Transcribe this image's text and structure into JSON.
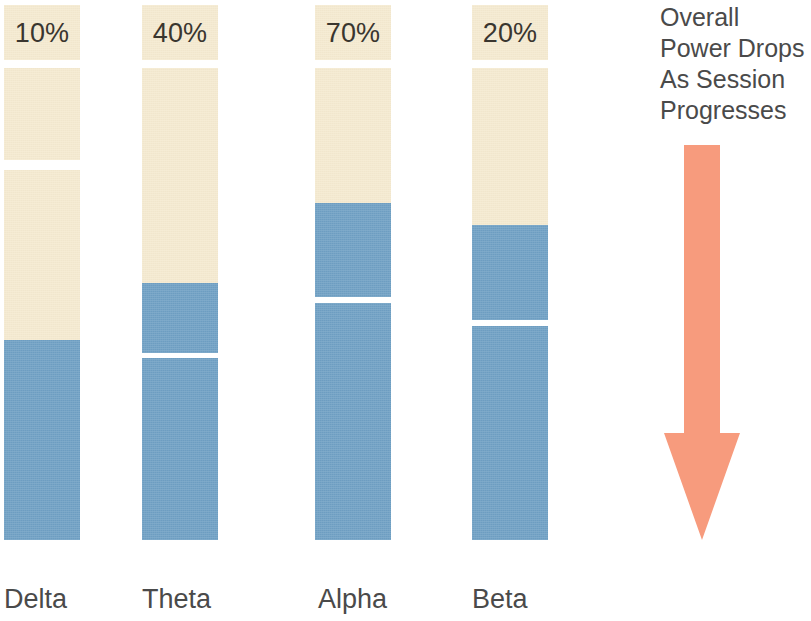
{
  "chart_data": {
    "type": "bar",
    "title": "",
    "subtitle": "",
    "xlabel": "",
    "ylabel": "",
    "categories": [
      "Delta",
      "Theta",
      "Alpha",
      "Beta"
    ],
    "data_labels": [
      "10%",
      "40%",
      "70%",
      "20%"
    ],
    "series": [
      {
        "name": "Remaining power (cream)",
        "values": [
          63,
          52,
          37,
          41
        ]
      },
      {
        "name": "Power drop (blue)",
        "values": [
          37,
          48,
          63,
          59
        ]
      }
    ],
    "legend_position": "none",
    "grid": false,
    "ylim": [
      0,
      100
    ],
    "annotations": [
      {
        "kind": "text-block",
        "text": "Overall Power Drops As Session Progresses",
        "position": "right-top"
      },
      {
        "kind": "arrow",
        "direction": "down",
        "position": "right",
        "color": "#f79b7d"
      }
    ],
    "colors": {
      "cream": "#f5ead0",
      "blue": "#6fa0c4",
      "arrow": "#f79b7d",
      "background": "#ffffff",
      "text": "#4a4a4a"
    },
    "note": "Each column is a stacked bar split into blocks by thin white gaps; the percentage caption sits in the topmost cream block of each column."
  },
  "columns": [
    {
      "name": "delta",
      "label": "Delta",
      "percent": "10%",
      "x": 4,
      "width": 76,
      "label_left": 4,
      "segments": [
        {
          "tone": "cream",
          "top": 0,
          "height": 55,
          "has_label": true
        },
        {
          "tone": "cream",
          "top": 63,
          "height": 92,
          "has_label": false
        },
        {
          "tone": "cream",
          "top": 165,
          "height": 170,
          "has_label": false
        },
        {
          "tone": "blue",
          "top": 335,
          "height": 200,
          "has_label": false
        }
      ]
    },
    {
      "name": "theta",
      "label": "Theta",
      "percent": "40%",
      "x": 142,
      "width": 76,
      "label_left": 142,
      "segments": [
        {
          "tone": "cream",
          "top": 0,
          "height": 55,
          "has_label": true
        },
        {
          "tone": "cream",
          "top": 63,
          "height": 215,
          "has_label": false
        },
        {
          "tone": "blue",
          "top": 278,
          "height": 70,
          "has_label": false
        },
        {
          "tone": "blue",
          "top": 353,
          "height": 182,
          "has_label": false
        }
      ]
    },
    {
      "name": "alpha",
      "label": "Alpha",
      "percent": "70%",
      "x": 315,
      "width": 76,
      "label_left": 318,
      "segments": [
        {
          "tone": "cream",
          "top": 0,
          "height": 55,
          "has_label": true
        },
        {
          "tone": "cream",
          "top": 63,
          "height": 135,
          "has_label": false
        },
        {
          "tone": "blue",
          "top": 198,
          "height": 94,
          "has_label": false
        },
        {
          "tone": "blue",
          "top": 298,
          "height": 237,
          "has_label": false
        }
      ]
    },
    {
      "name": "beta",
      "label": "Beta",
      "percent": "20%",
      "x": 472,
      "width": 76,
      "label_left": 472,
      "segments": [
        {
          "tone": "cream",
          "top": 0,
          "height": 55,
          "has_label": true
        },
        {
          "tone": "cream",
          "top": 63,
          "height": 157,
          "has_label": false
        },
        {
          "tone": "blue",
          "top": 220,
          "height": 95,
          "has_label": false
        },
        {
          "tone": "blue",
          "top": 321,
          "height": 214,
          "has_label": false
        }
      ]
    }
  ],
  "annotation": {
    "lines": [
      "Overall",
      "Power Drops",
      "As Session",
      "Progresses"
    ],
    "arrow_label": "downward-trend-arrow"
  }
}
